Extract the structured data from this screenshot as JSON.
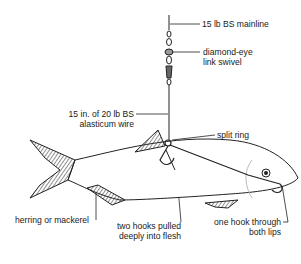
{
  "diagram": {
    "labels": {
      "mainline": "15 lb BS mainline",
      "swivel_1": "diamond-eye",
      "swivel_2": "link swivel",
      "wire_1": "15 in. of 20 lb BS",
      "wire_2": "alasticum wire",
      "split_ring": "split ring",
      "bait": "herring or mackerel",
      "hooks_body_1": "two hooks pulled",
      "hooks_body_2": "deeply into flesh",
      "hook_lips_1": "one hook through",
      "hook_lips_2": "both lips"
    }
  }
}
